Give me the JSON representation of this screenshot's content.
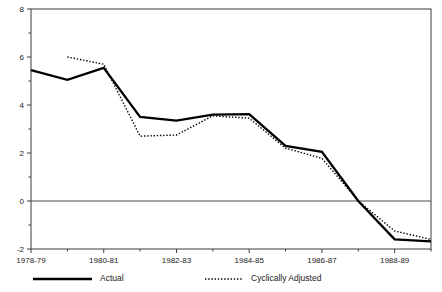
{
  "chart_data": {
    "type": "line",
    "title": "",
    "subtitle": "",
    "xlabel": "",
    "ylabel": "",
    "grid": false,
    "zero_line": true,
    "legend_position": "bottom",
    "x": [
      "1978-79",
      "1979-80",
      "1980-81",
      "1981-82",
      "1982-83",
      "1983-84",
      "1984-85",
      "1985-86",
      "1986-87",
      "1987-88",
      "1988-89",
      "1989-90"
    ],
    "xtick_labels": [
      "1978-79",
      "1980-81",
      "1982-83",
      "1984-85",
      "1986-87",
      "1988-89"
    ],
    "xtick_indices": [
      0,
      2,
      4,
      6,
      8,
      10
    ],
    "ytick_labels": [
      "8",
      "6",
      "4",
      "2",
      "0",
      "-2"
    ],
    "ytick_values": [
      8,
      6,
      4,
      2,
      0,
      -2
    ],
    "yminor_values": [
      7,
      5,
      3,
      1,
      -1
    ],
    "ylim": [
      -2,
      8
    ],
    "series": [
      {
        "name": "Actual",
        "style": "solid",
        "color": "#000000",
        "values": [
          5.45,
          5.05,
          5.55,
          3.5,
          3.35,
          3.6,
          3.62,
          2.3,
          2.05,
          0.0,
          -1.6,
          -1.68
        ]
      },
      {
        "name": "Cyclically Adjusted",
        "style": "dotted",
        "color": "#000000",
        "values": [
          null,
          6.0,
          5.7,
          2.7,
          2.75,
          3.55,
          3.45,
          2.2,
          1.78,
          0.0,
          -1.25,
          -1.6
        ]
      }
    ]
  },
  "legend": {
    "items": [
      {
        "label": "Actual",
        "style": "solid"
      },
      {
        "label": "Cyclically Adjusted",
        "style": "dotted"
      }
    ]
  }
}
